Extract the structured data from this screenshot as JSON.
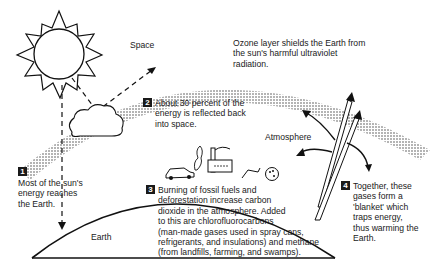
{
  "labels": {
    "space": "Space",
    "atmosphere": "Atmosphere",
    "earth": "Earth"
  },
  "ozone": {
    "lines": [
      "Ozone layer shields the Earth from",
      "the sun's harmful ultraviolet",
      "radiation."
    ]
  },
  "steps": [
    {
      "number": "1",
      "lines": [
        "Most of the sun's",
        "energy reaches",
        "the Earth."
      ]
    },
    {
      "number": "2",
      "lines": [
        "About 30 percent of the",
        "energy is reflected back",
        "into space."
      ]
    },
    {
      "number": "3",
      "lines": [
        "Burning of fossil fuels and",
        "deforestation increase carbon",
        "dioxide in the atmosphere. Added",
        "to this are chlorofluorocarbons",
        "(man-made gases used in spray cans,",
        "refrigerants, and insulations) and methane",
        "(from landfills, farming, and swamps)."
      ]
    },
    {
      "number": "4",
      "lines": [
        "Together, these",
        "gases form a",
        "'blanket' which",
        "traps energy,",
        "thus warming the",
        "Earth."
      ]
    }
  ],
  "icons": [
    "sun-icon",
    "cloud-icon",
    "car-icon",
    "factory-icon",
    "tree-icon"
  ]
}
